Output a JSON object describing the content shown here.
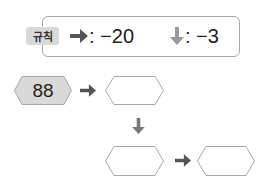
{
  "rule": {
    "badge_label": "규칙",
    "right_arrow_icon": "right-arrow-icon",
    "right_rule": ": −20",
    "down_arrow_icon": "down-arrow-icon",
    "down_rule": ": −3"
  },
  "diagram": {
    "start_value": "88",
    "boxes": [
      "",
      "",
      ""
    ],
    "colors": {
      "arrow": "#555555",
      "down_arrow": "#777777",
      "start_fill": "#d9d9d9",
      "border": "#a8a8a8"
    }
  }
}
